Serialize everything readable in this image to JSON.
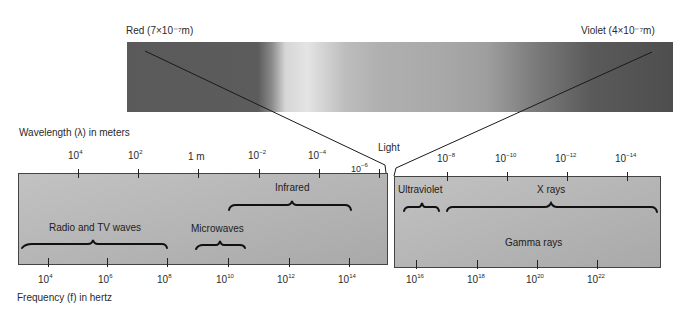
{
  "figure": {
    "title_red": "Red (7×10⁻⁷m)",
    "title_violet": "Violet  (4×10⁻⁷m)",
    "light_label": "Light",
    "wavelength_axis_label": "Wavelength (λ) in meters",
    "frequency_axis_label": "Frequency (f) in hertz",
    "wavelength_ticks_left": [
      {
        "base": "10",
        "exp": "4"
      },
      {
        "base": "10",
        "exp": "2"
      },
      {
        "base": "1 m",
        "exp": ""
      },
      {
        "base": "10",
        "exp": "−2"
      },
      {
        "base": "10",
        "exp": "−4"
      },
      {
        "base": "10",
        "exp": "−6"
      }
    ],
    "wavelength_ticks_right": [
      {
        "base": "10",
        "exp": "−8"
      },
      {
        "base": "10",
        "exp": "−10"
      },
      {
        "base": "10",
        "exp": "−12"
      },
      {
        "base": "10",
        "exp": "−14"
      }
    ],
    "frequency_ticks_left": [
      {
        "base": "10",
        "exp": "4"
      },
      {
        "base": "10",
        "exp": "6"
      },
      {
        "base": "10",
        "exp": "8"
      },
      {
        "base": "10",
        "exp": "10"
      },
      {
        "base": "10",
        "exp": "12"
      },
      {
        "base": "10",
        "exp": "14"
      }
    ],
    "frequency_ticks_right": [
      {
        "base": "10",
        "exp": "16"
      },
      {
        "base": "10",
        "exp": "18"
      },
      {
        "base": "10",
        "exp": "20"
      },
      {
        "base": "10",
        "exp": "22"
      }
    ],
    "bands": {
      "radio": "Radio and TV waves",
      "microwaves": "Microwaves",
      "infrared": "Infrared",
      "ultraviolet": "Ultraviolet",
      "xrays": "X rays",
      "gamma": "Gamma rays"
    },
    "colors": {
      "box_fill": "#b8b8b8",
      "spectrum_dark": "#5a5a5a",
      "spectrum_light": "#e4e4e4",
      "line": "#1a1a1a"
    }
  }
}
